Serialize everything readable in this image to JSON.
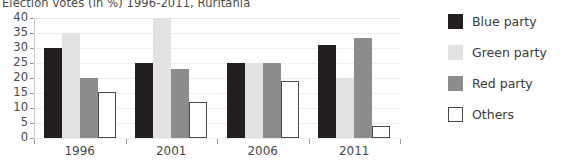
{
  "chart_data": {
    "type": "bar",
    "title": "Election votes (in %) 1996-2011, Ruritania",
    "xlabel": "",
    "ylabel": "",
    "categories": [
      "1996",
      "2001",
      "2006",
      "2011"
    ],
    "series": [
      {
        "name": "Blue party",
        "values": [
          30,
          25,
          25,
          31
        ],
        "color": "#231f20"
      },
      {
        "name": "Green party",
        "values": [
          35,
          40,
          25,
          20
        ],
        "color": "#e2e2e2"
      },
      {
        "name": "Red party",
        "values": [
          20,
          23,
          25,
          33.5
        ],
        "color": "#8c8c8c"
      },
      {
        "name": "Others",
        "values": [
          15.5,
          12,
          19,
          4
        ],
        "color": "#ffffff"
      }
    ],
    "ylim": [
      0,
      40
    ],
    "yticks": [
      0,
      5,
      10,
      15,
      20,
      25,
      30,
      35,
      40
    ],
    "ytick_labels": [
      "0",
      "5",
      "10",
      "15",
      "20",
      "25",
      "30",
      "35",
      "40"
    ],
    "grid": true,
    "legend_position": "right"
  }
}
